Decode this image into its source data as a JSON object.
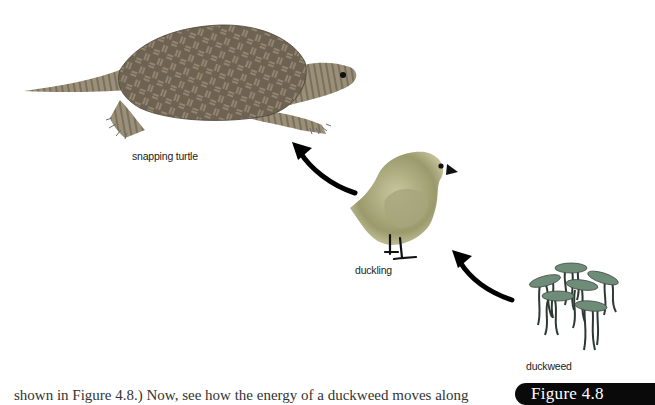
{
  "figure": {
    "badge": "Figure 4.8",
    "caption_fragment": "shown in Figure 4.8.) Now, see how the energy of a duckweed moves along"
  },
  "organisms": [
    {
      "name": "snapping turtle",
      "role": "consumer"
    },
    {
      "name": "duckling",
      "role": "consumer"
    },
    {
      "name": "duckweed",
      "role": "producer"
    }
  ],
  "labels": {
    "turtle": "snapping turtle",
    "duckling": "duckling",
    "duckweed": "duckweed"
  },
  "arrows": [
    {
      "from": "duckweed",
      "to": "duckling"
    },
    {
      "from": "duckling",
      "to": "snapping turtle"
    }
  ],
  "colors": {
    "turtle_shell": "#6e6352",
    "turtle_skin": "#8c8270",
    "duckling": "#b5b48a",
    "duckweed_frond": "#6f8c78",
    "arrow": "#000000",
    "badge_bg": "#0a0a0a"
  }
}
